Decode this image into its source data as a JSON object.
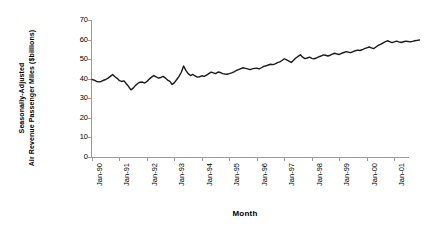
{
  "chart_data": {
    "type": "line",
    "title": "",
    "xlabel": "Month",
    "ylabel": "Seasonally-Adjusted Air Revenue Passenger Miles ($billions)",
    "ylabel_lines": [
      "Seasonally-Adjusted",
      "Air Revenue Passenger Miles ($billions)"
    ],
    "ylim": [
      0,
      70
    ],
    "ytick_labels": [
      "70",
      "60",
      "50",
      "40",
      "30",
      "20",
      "10",
      "0"
    ],
    "ytick_values": [
      70,
      60,
      50,
      40,
      30,
      20,
      10,
      0
    ],
    "xtick_labels": [
      "Jan-90",
      "Jan-91",
      "Jan-92",
      "Jan-93",
      "Jan-94",
      "Jan-95",
      "Jan-96",
      "Jan-97",
      "Jan-98",
      "Jan-99",
      "Jan-00",
      "Jan-01"
    ],
    "xtick_values": [
      0,
      12,
      24,
      36,
      48,
      60,
      72,
      84,
      96,
      108,
      120,
      132
    ],
    "grid": false,
    "legend": false,
    "line_color": "#1a1a1a",
    "line_width": 1.4,
    "series": [
      {
        "name": "Seasonally-Adjusted Air Revenue Passenger Miles",
        "x_start_label": "Jan-90",
        "x_end_label": "Jun-01",
        "values": [
          39.6,
          39.3,
          38.6,
          38.4,
          38.6,
          39.2,
          39.6,
          40.3,
          41.2,
          42.2,
          41.0,
          40.2,
          39.0,
          38.6,
          38.9,
          37.4,
          36.0,
          34.3,
          35.2,
          36.6,
          37.6,
          38.2,
          38.3,
          37.8,
          38.6,
          39.8,
          40.8,
          41.6,
          41.0,
          40.3,
          40.6,
          41.2,
          40.4,
          39.3,
          38.6,
          37.0,
          38.0,
          39.6,
          41.2,
          43.3,
          46.5,
          44.3,
          42.6,
          41.6,
          42.2,
          41.4,
          40.8,
          41.0,
          41.5,
          41.2,
          41.8,
          42.6,
          43.4,
          43.0,
          42.6,
          43.4,
          43.2,
          42.6,
          42.4,
          42.3,
          42.6,
          43.0,
          43.5,
          44.2,
          44.6,
          45.2,
          45.6,
          45.3,
          45.0,
          44.6,
          45.0,
          45.3,
          45.4,
          45.0,
          45.6,
          46.3,
          46.6,
          47.0,
          47.4,
          47.2,
          47.6,
          48.2,
          48.6,
          49.3,
          50.2,
          49.6,
          49.0,
          48.3,
          49.4,
          50.6,
          51.4,
          52.2,
          51.0,
          50.3,
          50.6,
          51.0,
          50.4,
          50.2,
          50.6,
          51.2,
          51.6,
          52.2,
          52.0,
          51.6,
          52.0,
          52.6,
          53.0,
          52.6,
          52.4,
          53.0,
          53.4,
          53.8,
          53.6,
          53.3,
          53.8,
          54.3,
          54.6,
          54.4,
          54.8,
          55.4,
          55.8,
          56.2,
          55.8,
          55.4,
          56.2,
          57.0,
          57.6,
          58.2,
          58.8,
          59.4,
          58.9,
          58.4,
          58.8,
          59.2,
          58.8,
          58.5,
          58.9,
          59.2,
          59.0,
          58.8,
          59.1,
          59.4,
          59.6,
          59.8
        ]
      }
    ]
  }
}
